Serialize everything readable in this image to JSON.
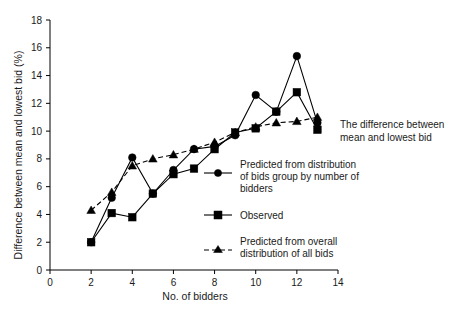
{
  "chart_data": {
    "type": "line",
    "title": "",
    "xlabel": "No. of bidders",
    "ylabel": "Difference between mean and lowest bid (%)",
    "xlim": [
      0,
      14
    ],
    "ylim": [
      0,
      18
    ],
    "xticks": [
      0,
      2,
      4,
      6,
      8,
      10,
      12,
      14
    ],
    "yticks": [
      0,
      2,
      4,
      6,
      8,
      10,
      12,
      14,
      16,
      18
    ],
    "grid": false,
    "legend_position": "inside-lower-right",
    "annotation": "The difference between mean and lowest bid",
    "x": [
      2,
      3,
      4,
      5,
      6,
      7,
      8,
      9,
      10,
      11,
      12,
      13
    ],
    "series": [
      {
        "name": "Predicted from distribution of bids group by number of bidders",
        "marker": "circle",
        "linestyle": "solid",
        "values": [
          2.0,
          5.2,
          8.1,
          5.5,
          7.2,
          8.7,
          8.9,
          9.7,
          12.6,
          11.4,
          15.4,
          10.6
        ]
      },
      {
        "name": "Observed",
        "marker": "square",
        "linestyle": "solid",
        "values": [
          2.0,
          4.1,
          3.8,
          5.5,
          6.9,
          7.3,
          8.7,
          9.9,
          10.2,
          11.4,
          12.8,
          10.1
        ]
      },
      {
        "name": "Predicted from overall distribution of all bids",
        "marker": "triangle",
        "linestyle": "dashed",
        "values": [
          4.3,
          5.6,
          7.5,
          8.0,
          8.3,
          8.7,
          9.2,
          9.9,
          10.3,
          10.6,
          10.7,
          11.0
        ]
      }
    ]
  },
  "axes": {
    "x_label": "No. of bidders",
    "y_label": "Difference between mean and lowest bid (%)",
    "x_tick_labels": [
      "0",
      "2",
      "4",
      "6",
      "8",
      "10",
      "12",
      "14"
    ],
    "y_tick_labels": [
      "0",
      "2",
      "4",
      "6",
      "8",
      "10",
      "12",
      "14",
      "16",
      "18"
    ]
  },
  "annotation": {
    "line1": "The difference between",
    "line2": "mean and lowest bid"
  },
  "legend": {
    "entries": [
      {
        "marker": "circle",
        "line1": "Predicted from distribution",
        "line2": "of bids group by number of",
        "line3": "bidders"
      },
      {
        "marker": "square",
        "line1": "Observed",
        "line2": "",
        "line3": ""
      },
      {
        "marker": "triangle",
        "line1": "Predicted from overall",
        "line2": "distribution of all bids",
        "line3": ""
      }
    ]
  },
  "colors": {
    "ink": "#000000",
    "background": "#ffffff"
  }
}
